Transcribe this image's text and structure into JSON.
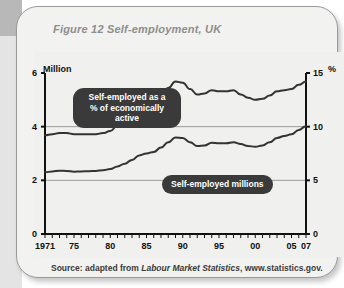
{
  "figure": {
    "title": "Figure 12 Self-employment, UK",
    "source_prefix": "Source: adapted from ",
    "source_publication": "Labour Market Statistics",
    "source_suffix": ", www.statistics.gov."
  },
  "callouts": {
    "percentage": "Self-employed as a\n% of economically active",
    "millions": "Self-employed millions"
  },
  "axis": {
    "left_unit": "Million",
    "right_unit": "%",
    "left_ticks": [
      "6",
      "4",
      "2",
      "0"
    ],
    "right_ticks": [
      "15",
      "10",
      "5",
      "0"
    ],
    "x_ticks": [
      "1971",
      "75",
      "80",
      "85",
      "90",
      "95",
      "00",
      "05",
      "07"
    ]
  },
  "colors": {
    "card_background": "#f2f2f0",
    "panel_background": "#f0f0ee",
    "line": "#333333",
    "gridline": "#9a9a9a",
    "axis": "#111111",
    "title_text": "#8e8e8e",
    "callout_background": "#3a3a3a",
    "callout_text": "#ffffff"
  },
  "chart_data": {
    "type": "line",
    "title": "Figure 12 Self-employment, UK",
    "xlabel": "",
    "ylabel": "Million",
    "y2label": "%",
    "ylim": [
      0,
      6
    ],
    "y2lim": [
      0,
      15
    ],
    "xlim": [
      1971,
      2007
    ],
    "grid": true,
    "legend": "annotations",
    "x": [
      1971,
      1972,
      1973,
      1974,
      1975,
      1976,
      1977,
      1978,
      1979,
      1980,
      1981,
      1982,
      1983,
      1984,
      1985,
      1986,
      1987,
      1988,
      1989,
      1990,
      1991,
      1992,
      1993,
      1994,
      1995,
      1996,
      1997,
      1998,
      1999,
      2000,
      2001,
      2002,
      2003,
      2004,
      2005,
      2006,
      2007
    ],
    "series": [
      {
        "name": "Self-employed millions",
        "axis": "left",
        "unit": "million",
        "values": [
          2.3,
          2.33,
          2.36,
          2.35,
          2.32,
          2.33,
          2.34,
          2.35,
          2.38,
          2.42,
          2.52,
          2.62,
          2.76,
          2.93,
          3.0,
          3.06,
          3.22,
          3.42,
          3.6,
          3.58,
          3.42,
          3.28,
          3.3,
          3.4,
          3.38,
          3.38,
          3.42,
          3.35,
          3.28,
          3.25,
          3.3,
          3.42,
          3.58,
          3.65,
          3.72,
          3.88,
          4.02
        ]
      },
      {
        "name": "Self-employed as a % of economically active",
        "axis": "right",
        "unit": "percent",
        "values": [
          9.2,
          9.3,
          9.4,
          9.4,
          9.3,
          9.3,
          9.3,
          9.3,
          9.4,
          9.6,
          10.1,
          10.6,
          11.2,
          11.8,
          12.1,
          12.3,
          12.9,
          13.6,
          14.2,
          14.1,
          13.5,
          13.0,
          13.1,
          13.4,
          13.3,
          13.3,
          13.4,
          13.0,
          12.7,
          12.5,
          12.6,
          12.9,
          13.3,
          13.4,
          13.5,
          13.9,
          14.2
        ]
      }
    ]
  }
}
